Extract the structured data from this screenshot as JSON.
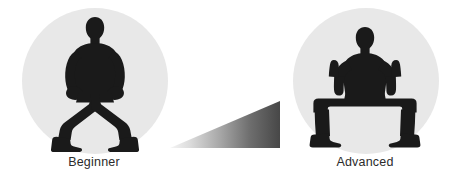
{
  "graphic": {
    "title": "Squat progression",
    "background_color": "#ffffff",
    "silhouette_color": "#1a1a1a",
    "disc_color": "#e8e8e8",
    "caption_color": "#2b2b2b"
  },
  "panels": [
    {
      "id": "beginner",
      "label": "Beginner",
      "pose": "shallow-wide-squat-hands-on-thighs",
      "icon_name": "squat-beginner-silhouette"
    },
    {
      "id": "advanced",
      "label": "Advanced",
      "pose": "deep-horse-stance-arms-raised-fists",
      "icon_name": "squat-advanced-silhouette"
    }
  ],
  "progression_arrow": {
    "name": "difficulty-ramp",
    "shape": "right-triangle",
    "direction": "left-to-right-increasing",
    "gradient_from": "#f2f2f2",
    "gradient_to": "#4a4a4a"
  }
}
